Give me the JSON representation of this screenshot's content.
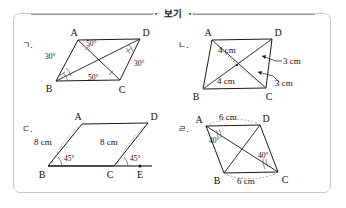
{
  "header": {
    "label": "보기",
    "left_rule": "",
    "right_rule": ""
  },
  "figures": [
    {
      "tag": "ㄱ.",
      "vertices": {
        "A": "A",
        "B": "B",
        "C": "C",
        "D": "D"
      },
      "labels": [
        "30°",
        "50°",
        "50°",
        "30°"
      ],
      "angle_bac": "30°",
      "angle_dac": "50°",
      "angle_bca": "50°",
      "angle_bdc": "30°"
    },
    {
      "tag": "ㄴ.",
      "vertices": {
        "A": "A",
        "B": "B",
        "C": "C",
        "D": "D"
      },
      "labels": [
        "4 cm",
        "3 cm",
        "4 cm",
        "3 cm"
      ],
      "seg_ao": "4 cm",
      "seg_od": "3 cm",
      "seg_bo": "4 cm",
      "seg_oc": "3 cm"
    },
    {
      "tag": "ㄷ.",
      "vertices": {
        "A": "A",
        "B": "B",
        "C": "C",
        "D": "D",
        "E": "E"
      },
      "labels": [
        "8 cm",
        "45°",
        "8 cm",
        "45°"
      ],
      "seg_ab": "8 cm",
      "angle_abc": "45°",
      "seg_cd": "8 cm",
      "angle_dce": "45°"
    },
    {
      "tag": "ㄹ.",
      "vertices": {
        "A": "A",
        "B": "B",
        "C": "C",
        "D": "D"
      },
      "labels": [
        "6 cm",
        "40°",
        "40°",
        "6 cm"
      ],
      "seg_ad": "6 cm",
      "angle_dab": "40°",
      "angle_bcd": "40°",
      "seg_bc": "6 cm"
    }
  ],
  "colors": {
    "frame_border": "#c9c9c9",
    "stroke": "#1a1a1a",
    "dashed": "#8a8a8a",
    "text": "#1a1a1a"
  }
}
